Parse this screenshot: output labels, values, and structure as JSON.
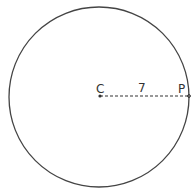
{
  "diagram": {
    "type": "circle-radius",
    "center_label": "C",
    "point_label": "P",
    "radius_label": "7",
    "stroke_color": "#333333"
  }
}
